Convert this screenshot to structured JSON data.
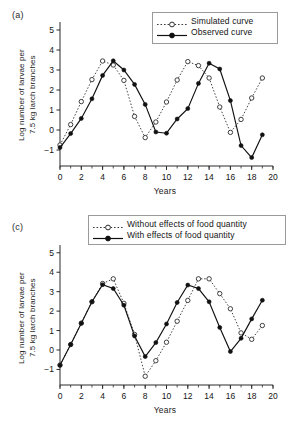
{
  "figure": {
    "width": 290,
    "height": 430,
    "background": "#ffffff",
    "panels": [
      "(a)",
      "(c)"
    ]
  },
  "chart_data": [
    {
      "id": "panel-a",
      "panel_label": "(a)",
      "type": "line",
      "title": "",
      "xlabel": "Years",
      "ylabel": "Log number of larvae per\n7.5 kg larch branches",
      "xlim": [
        0,
        20
      ],
      "ylim": [
        -1.8,
        5.4
      ],
      "xticks": [
        0,
        2,
        4,
        6,
        8,
        10,
        12,
        14,
        16,
        18,
        20
      ],
      "xtick_labels": [
        "0",
        "2",
        "4",
        "6",
        "8",
        "10",
        "12",
        "14",
        "16",
        "18",
        "20"
      ],
      "xminor_step": 1,
      "yticks": [
        -1,
        0,
        1,
        2,
        3,
        4,
        5
      ],
      "ytick_labels": [
        "−1",
        "0",
        "1",
        "2",
        "3",
        "4",
        "5"
      ],
      "grid": false,
      "legend_position": "top-right",
      "series": [
        {
          "name": "Simulated curve",
          "style": "dotted",
          "marker": "open-circle",
          "color": "#3a3a3a",
          "x": [
            0,
            1,
            2,
            3,
            4,
            5,
            6,
            7,
            8,
            9,
            10,
            11,
            12,
            13,
            14,
            15,
            16,
            17,
            18,
            19
          ],
          "y": [
            -0.75,
            0.27,
            1.42,
            2.52,
            3.45,
            3.25,
            2.48,
            0.68,
            -0.38,
            0.4,
            1.4,
            2.5,
            3.42,
            3.22,
            2.6,
            1.15,
            -0.12,
            0.53,
            1.6,
            2.6
          ]
        },
        {
          "name": "Observed curve",
          "style": "solid",
          "marker": "filled-circle",
          "color": "#111111",
          "x": [
            0,
            1,
            2,
            3,
            4,
            5,
            6,
            7,
            8,
            9,
            10,
            11,
            12,
            13,
            14,
            15,
            16,
            17,
            18,
            19
          ],
          "y": [
            -0.88,
            -0.18,
            0.58,
            1.56,
            2.73,
            3.46,
            3.0,
            2.28,
            1.28,
            -0.1,
            -0.16,
            0.55,
            1.07,
            2.33,
            3.34,
            3.05,
            1.47,
            -0.78,
            -1.38,
            -0.24
          ]
        }
      ]
    },
    {
      "id": "panel-c",
      "panel_label": "(c)",
      "type": "line",
      "title": "",
      "xlabel": "Years",
      "ylabel": "Log number of larvae per\n7.5 kg larch branches",
      "xlim": [
        0,
        20
      ],
      "ylim": [
        -1.8,
        5.4
      ],
      "xticks": [
        0,
        2,
        4,
        6,
        8,
        10,
        12,
        14,
        16,
        18,
        20
      ],
      "xtick_labels": [
        "0",
        "2",
        "4",
        "6",
        "8",
        "10",
        "12",
        "14",
        "16",
        "18",
        "20"
      ],
      "xminor_step": 1,
      "yticks": [
        -1,
        0,
        1,
        2,
        3,
        4,
        5
      ],
      "ytick_labels": [
        "−1",
        "0",
        "1",
        "2",
        "3",
        "4",
        "5"
      ],
      "grid": false,
      "legend_position": "top-right",
      "series": [
        {
          "name": "Without effects of food quantity",
          "style": "dotted",
          "marker": "open-circle",
          "color": "#3a3a3a",
          "x": [
            0,
            1,
            2,
            3,
            4,
            5,
            6,
            7,
            8,
            9,
            10,
            11,
            12,
            13,
            14,
            15,
            16,
            17,
            18,
            19
          ],
          "y": [
            -0.78,
            0.28,
            1.38,
            2.48,
            3.42,
            3.66,
            2.4,
            0.8,
            -1.35,
            -0.55,
            0.4,
            1.48,
            2.55,
            3.66,
            3.66,
            2.9,
            2.12,
            0.88,
            0.55,
            1.26
          ]
        },
        {
          "name": "With effects of food quantity",
          "style": "solid",
          "marker": "filled-circle",
          "color": "#111111",
          "x": [
            0,
            1,
            2,
            3,
            4,
            5,
            6,
            7,
            8,
            9,
            10,
            11,
            12,
            13,
            14,
            15,
            16,
            17,
            18,
            19
          ],
          "y": [
            -0.78,
            0.28,
            1.38,
            2.48,
            3.36,
            3.16,
            2.3,
            0.72,
            -0.34,
            0.38,
            1.34,
            2.44,
            3.34,
            3.16,
            2.48,
            1.16,
            -0.08,
            0.6,
            1.6,
            2.56
          ]
        }
      ]
    }
  ],
  "panel_a": {
    "label": "(a)",
    "xlabel": "Years",
    "ylabel": "Log number of larvae per\n7.5 kg larch branches",
    "legend": [
      {
        "label": "Simulated curve",
        "style": "dotted",
        "marker": "open-circle"
      },
      {
        "label": "Observed curve",
        "style": "solid",
        "marker": "filled-circle"
      }
    ]
  },
  "panel_c": {
    "label": "(c)",
    "xlabel": "Years",
    "ylabel": "Log number of larvae per\n7.5 kg larch branches",
    "legend": [
      {
        "label": "Without effects of food quantity",
        "style": "dotted",
        "marker": "open-circle"
      },
      {
        "label": "With effects of food quantity",
        "style": "solid",
        "marker": "filled-circle"
      }
    ]
  },
  "colors": {
    "axis": "#2b2b2b",
    "solid_series": "#111111",
    "dotted_series": "#3a3a3a",
    "text": "#141414",
    "legend_border": "#9a9a9a"
  }
}
